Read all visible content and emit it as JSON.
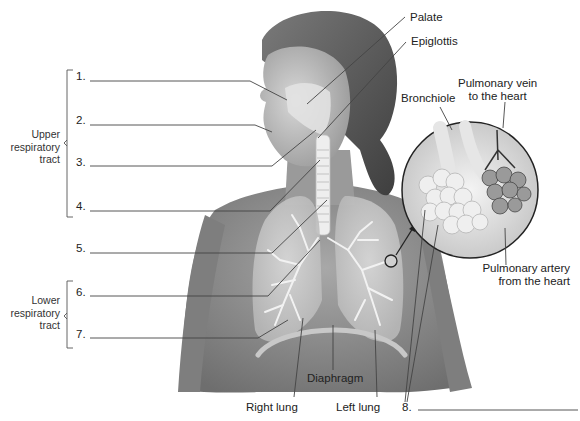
{
  "diagram": {
    "groups": [
      {
        "id": "upper",
        "label": "Upper respiratory tract",
        "lines": [
          "Upper",
          "respiratory",
          "tract"
        ],
        "covers": [
          1,
          2,
          3,
          4
        ]
      },
      {
        "id": "lower",
        "label": "Lower respiratory tract",
        "lines": [
          "Lower",
          "respiratory",
          "tract"
        ],
        "covers": [
          6,
          7
        ]
      }
    ],
    "blanks": [
      {
        "number": "1.",
        "answer": ""
      },
      {
        "number": "2.",
        "answer": ""
      },
      {
        "number": "3.",
        "answer": ""
      },
      {
        "number": "4.",
        "answer": ""
      },
      {
        "number": "5.",
        "answer": ""
      },
      {
        "number": "6.",
        "answer": ""
      },
      {
        "number": "7.",
        "answer": ""
      },
      {
        "number": "8.",
        "answer": ""
      }
    ],
    "labels": {
      "palate": "Palate",
      "epiglottis": "Epiglottis",
      "bronchiole": "Bronchiole",
      "pulmonary_vein": [
        "Pulmonary vein",
        "to the heart"
      ],
      "pulmonary_artery": [
        "Pulmonary artery",
        "from the heart"
      ],
      "diaphragm": "Diaphragm",
      "right_lung": "Right lung",
      "left_lung": "Left lung"
    },
    "colors": {
      "skin": "#8c8c8c",
      "skin_light": "#b5b5b5",
      "hair": "#5a5a5a",
      "lung": "#cfcfcf",
      "airway": "#e8e8e8",
      "leader_line": "#333333"
    }
  }
}
